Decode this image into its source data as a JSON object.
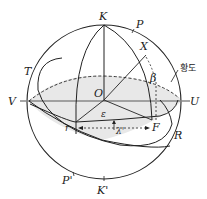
{
  "diagram": {
    "labels": {
      "K": "K",
      "P": "P",
      "X": "X",
      "T": "T",
      "V": "V",
      "O": "O",
      "U": "U",
      "epsilon": "ε",
      "beta": "β",
      "r": "r",
      "lambda": "λ'",
      "F": "F",
      "R": "R",
      "P_prime": "P'",
      "K_prime": "K'",
      "ecliptic": "황도"
    },
    "colors": {
      "stroke": "#222222",
      "shade": "#e6e6e6",
      "axis": "#888888"
    }
  }
}
